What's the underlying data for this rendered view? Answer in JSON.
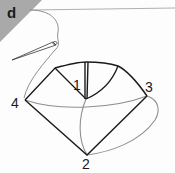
{
  "figure": {
    "panel_label": "d",
    "colors": {
      "corner": "#a9a9a9",
      "outline": "#1a1a1a",
      "thread": "#8f8f8f",
      "background": "#fdfdfd"
    },
    "vertices": [
      {
        "id": "1",
        "label": "1"
      },
      {
        "id": "2",
        "label": "2"
      },
      {
        "id": "3",
        "label": "3"
      },
      {
        "id": "4",
        "label": "4"
      }
    ]
  }
}
